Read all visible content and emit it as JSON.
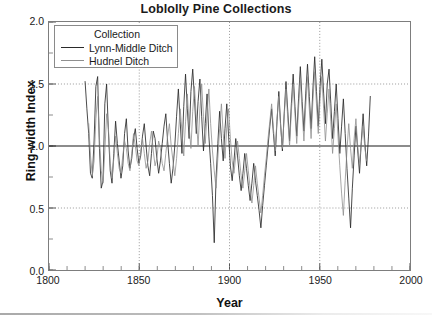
{
  "chart_data": {
    "type": "line",
    "title": "Loblolly Pine Collections",
    "xlabel": "Year",
    "ylabel": "Ring-width Index",
    "xlim": [
      1800,
      2000
    ],
    "ylim": [
      0.0,
      2.0
    ],
    "xticks": [
      1800,
      1850,
      1900,
      1950,
      2000
    ],
    "xtick_labels": [
      "1800",
      "1850",
      "1900",
      "1950",
      "2000"
    ],
    "x_minor_tick_step": 10,
    "yticks": [
      0.0,
      0.5,
      1.0,
      1.5,
      2.0
    ],
    "ytick_labels": [
      "0.0",
      "0.5",
      "1.0",
      "1.5",
      "2.0"
    ],
    "y_minor_tick_step": 0.25,
    "grid": "dotted gridlines at y=0.5 and y=1.5 and at x=1850, 1900, 1950",
    "gridlines_y": [
      0.5,
      1.5
    ],
    "gridlines_x": [
      1850,
      1900,
      1950
    ],
    "reference_line_y": 1.0,
    "legend_position": "upper left inside axes",
    "legend_title": "Collection",
    "series": [
      {
        "name": "Lynn-Middle Ditch",
        "color": "#2a2a2a",
        "x_start": 1820,
        "x_end": 1978,
        "values": [
          1.52,
          1.3,
          1.1,
          0.78,
          0.74,
          1.04,
          1.48,
          1.56,
          0.98,
          0.66,
          0.72,
          1.34,
          1.5,
          1.12,
          0.8,
          0.7,
          0.94,
          1.2,
          1.02,
          0.88,
          0.74,
          0.84,
          1.1,
          1.22,
          0.96,
          0.82,
          0.9,
          1.06,
          1.14,
          0.98,
          0.86,
          0.92,
          1.08,
          1.18,
          1.0,
          0.84,
          0.76,
          0.94,
          1.12,
          1.06,
          0.9,
          0.78,
          0.88,
          1.02,
          1.16,
          1.26,
          1.04,
          0.86,
          0.7,
          0.82,
          1.0,
          1.24,
          1.46,
          1.2,
          0.94,
          1.32,
          1.58,
          1.3,
          1.06,
          1.44,
          1.62,
          1.38,
          1.1,
          1.36,
          1.54,
          1.24,
          0.96,
          1.18,
          1.42,
          1.08,
          0.86,
          0.6,
          0.22,
          0.74,
          1.02,
          1.28,
          1.06,
          0.88,
          1.14,
          1.34,
          1.08,
          0.84,
          0.72,
          0.88,
          1.06,
          0.92,
          0.76,
          0.64,
          0.78,
          0.94,
          0.82,
          0.68,
          0.56,
          0.7,
          0.86,
          0.72,
          0.6,
          0.48,
          0.34,
          0.52,
          0.68,
          0.84,
          1.0,
          1.16,
          1.3,
          1.1,
          0.92,
          1.2,
          1.44,
          1.18,
          0.96,
          1.26,
          1.52,
          1.28,
          1.04,
          1.34,
          1.58,
          1.32,
          1.08,
          1.38,
          1.64,
          1.36,
          1.12,
          1.42,
          1.66,
          1.4,
          1.14,
          1.46,
          1.72,
          1.44,
          1.16,
          1.48,
          1.7,
          1.42,
          1.18,
          1.5,
          1.62,
          1.34,
          1.06,
          1.28,
          1.5,
          1.22,
          0.94,
          1.16,
          1.38,
          1.1,
          0.82,
          0.58,
          0.34,
          0.66,
          0.92,
          1.16,
          0.96,
          0.78,
          1.04,
          1.26,
          1.02,
          0.84,
          1.08,
          1.4
        ]
      },
      {
        "name": "Hudnel Ditch",
        "color": "#8f8f8f",
        "x_start": 1822,
        "x_end": 1976,
        "values": [
          1.18,
          0.92,
          0.76,
          0.88,
          1.22,
          1.4,
          1.06,
          0.8,
          0.7,
          0.96,
          1.26,
          1.14,
          0.86,
          0.74,
          0.9,
          1.08,
          0.94,
          0.82,
          0.78,
          0.92,
          1.04,
          0.98,
          0.86,
          0.8,
          0.94,
          1.1,
          1.0,
          0.88,
          0.84,
          0.96,
          1.06,
          0.94,
          0.82,
          0.88,
          1.02,
          1.12,
          0.96,
          0.84,
          0.9,
          1.04,
          0.98,
          0.86,
          0.8,
          0.94,
          1.08,
          1.18,
          1.0,
          0.88,
          0.76,
          0.9,
          1.1,
          1.3,
          1.12,
          0.92,
          1.2,
          1.42,
          1.16,
          0.98,
          1.28,
          1.48,
          1.22,
          1.0,
          1.3,
          1.5,
          1.24,
          1.02,
          1.26,
          1.46,
          1.18,
          0.96,
          0.8,
          0.66,
          0.9,
          1.14,
          1.34,
          1.1,
          0.9,
          1.16,
          1.3,
          1.06,
          0.88,
          0.78,
          0.92,
          1.04,
          0.9,
          0.76,
          0.66,
          0.8,
          0.94,
          0.8,
          0.66,
          0.54,
          0.68,
          0.84,
          0.7,
          0.58,
          0.46,
          0.6,
          0.76,
          0.9,
          1.06,
          1.2,
          1.34,
          1.14,
          0.96,
          1.22,
          1.4,
          1.16,
          0.98,
          1.24,
          1.46,
          1.22,
          1.0,
          1.28,
          1.5,
          1.26,
          1.02,
          1.3,
          1.54,
          1.28,
          1.04,
          1.32,
          1.56,
          1.3,
          1.06,
          1.36,
          1.6,
          1.34,
          1.1,
          1.38,
          1.56,
          1.3,
          1.04,
          1.26,
          1.46,
          1.2,
          0.94,
          1.14,
          1.34,
          1.08,
          0.84,
          0.62,
          0.44,
          0.72,
          0.96,
          1.18,
          0.98,
          0.82,
          1.06,
          1.22,
          1.0,
          0.86,
          1.02,
          1.16,
          0.98,
          0.88
        ]
      }
    ]
  },
  "legend": {
    "title": "Collection",
    "items": [
      {
        "label": "Lynn-Middle Ditch",
        "color": "#2a2a2a"
      },
      {
        "label": "Hudnel Ditch",
        "color": "#8f8f8f"
      }
    ]
  },
  "axes": {
    "title": "Loblolly Pine Collections",
    "x_title": "Year",
    "y_title": "Ring-width Index"
  }
}
